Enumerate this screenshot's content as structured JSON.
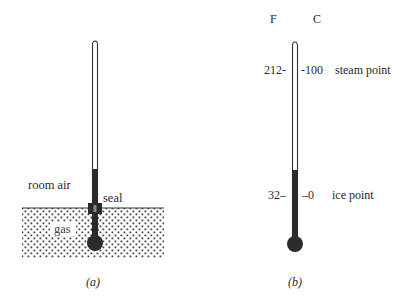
{
  "figure_a": {
    "caption": "(a)",
    "labels": {
      "room_air": "room air",
      "seal": "seal",
      "gas": "gas"
    }
  },
  "figure_b": {
    "caption": "(b)",
    "scale_headers": {
      "fahrenheit": "F",
      "celsius": "C"
    },
    "marks": [
      {
        "f": "212",
        "c": "100",
        "label": "steam point"
      },
      {
        "f": "32",
        "c": "0",
        "label": "ice point"
      }
    ]
  },
  "colors": {
    "ink": "#2a2a2a",
    "fill": "#2b2b2b",
    "gas_dots": "#444444",
    "background": "#ffffff"
  }
}
